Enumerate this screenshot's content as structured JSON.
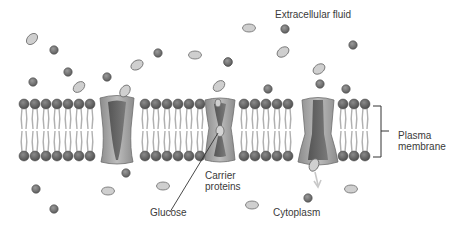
{
  "diagram": {
    "labels": {
      "extracellular": "Extracellular fluid",
      "plasma_line1": "Plasma",
      "plasma_line2": "membrane",
      "carrier_line1": "Carrier",
      "carrier_line2": "proteins",
      "glucose": "Glucose",
      "cytoplasm": "Cytoplasm"
    },
    "colors": {
      "background": "#ffffff",
      "phospholipid_head": "#6e6e6e",
      "phospholipid_tail": "#b4b4b4",
      "protein_outer": "#9c9c9c",
      "protein_inner": "#6a6a6a",
      "glucose_fill": "#cfcfcf",
      "molecule_fill": "#808080",
      "text": "#3a3a3a"
    },
    "membrane": {
      "x_start": 24,
      "x_end": 372,
      "top_head_y": 104,
      "bottom_head_y": 156,
      "head_spacing": 11
    },
    "carrier_proteins": [
      {
        "state": "open to extracellular side, glucose binding",
        "x": 117
      },
      {
        "state": "occluded, glucose inside",
        "x": 220
      },
      {
        "state": "open to cytoplasm, glucose released",
        "x": 318
      }
    ],
    "glucose_molecules_extracellular": 9,
    "glucose_molecules_cytoplasm": 5,
    "other_molecules_extracellular": 11,
    "other_molecules_cytoplasm": 5
  }
}
